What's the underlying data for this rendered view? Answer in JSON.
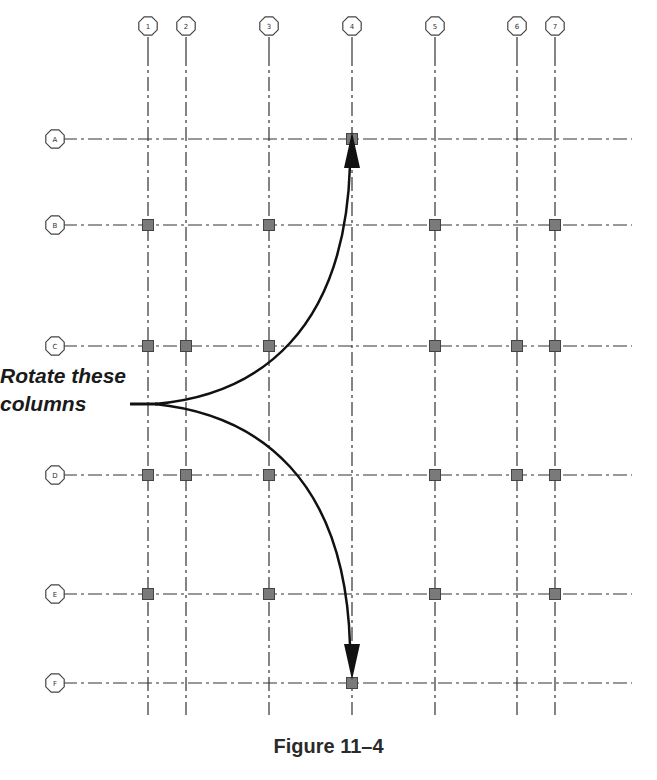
{
  "figure": {
    "caption": "Figure 11–4",
    "annotation_line1": "Rotate these",
    "annotation_line2": "columns"
  },
  "grid": {
    "columns": [
      {
        "label": "1",
        "x": 148
      },
      {
        "label": "2",
        "x": 186
      },
      {
        "label": "3",
        "x": 269
      },
      {
        "label": "4",
        "x": 352
      },
      {
        "label": "5",
        "x": 435
      },
      {
        "label": "6",
        "x": 517
      },
      {
        "label": "7",
        "x": 555
      }
    ],
    "rows": [
      {
        "label": "A",
        "y": 139
      },
      {
        "label": "B",
        "y": 225
      },
      {
        "label": "C",
        "y": 346
      },
      {
        "label": "D",
        "y": 475
      },
      {
        "label": "E",
        "y": 594
      },
      {
        "label": "F",
        "y": 683
      }
    ],
    "structural_columns": {
      "A": [
        "4"
      ],
      "B": [
        "1",
        "3",
        "5",
        "7"
      ],
      "C": [
        "1",
        "2",
        "3",
        "5",
        "6",
        "7"
      ],
      "D": [
        "1",
        "2",
        "3",
        "5",
        "6",
        "7"
      ],
      "E": [
        "1",
        "3",
        "5",
        "7"
      ],
      "F": [
        "4"
      ]
    }
  },
  "colors": {
    "gridline": "#333333",
    "column_fill": "#7a7a7a",
    "arrow": "#111111"
  }
}
